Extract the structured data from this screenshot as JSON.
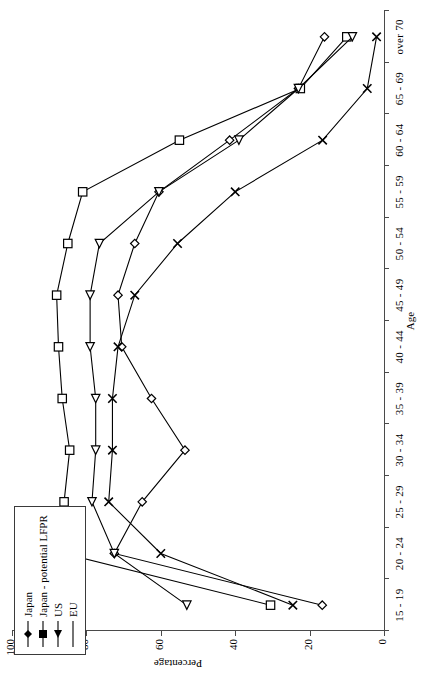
{
  "chart_data": {
    "type": "line",
    "title": "",
    "xlabel": "Age",
    "ylabel": "Percentage",
    "ylim": [
      0,
      100
    ],
    "yticks": [
      0,
      20,
      40,
      60,
      80,
      100
    ],
    "grid": false,
    "legend_position": "top-left",
    "categories": [
      "15 - 19",
      "20 - 24",
      "25 - 29",
      "30 - 34",
      "35 - 39",
      "40 - 44",
      "45 - 49",
      "50 - 54",
      "55 - 59",
      "60 - 64",
      "65 - 69",
      "over 70"
    ],
    "series": [
      {
        "name": "Japan",
        "marker": "diamond",
        "values": [
          16.6,
          72.5,
          65.0,
          53.5,
          62.5,
          70.5,
          71.5,
          67.0,
          60.5,
          41.5,
          23.0,
          16.0
        ]
      },
      {
        "name": "Japan - potential LFPR",
        "marker": "square",
        "values": [
          30.5,
          86.0,
          86.0,
          84.5,
          86.5,
          87.5,
          88.0,
          85.0,
          81.0,
          55.0,
          22.5,
          10.0
        ]
      },
      {
        "name": "US",
        "marker": "triangle",
        "values": [
          53.0,
          72.5,
          78.5,
          77.5,
          77.5,
          79.0,
          79.0,
          76.5,
          60.5,
          39.0,
          23.0,
          8.5
        ]
      },
      {
        "name": "EU",
        "marker": "x",
        "values": [
          24.5,
          60.0,
          74.0,
          73.0,
          73.0,
          71.5,
          67.0,
          55.5,
          40.0,
          16.5,
          4.5,
          2.0
        ]
      }
    ]
  },
  "legend": {
    "items": [
      {
        "label": "Japan",
        "marker": "diamond"
      },
      {
        "label": "Japan - potential LFPR",
        "marker": "square"
      },
      {
        "label": "US",
        "marker": "triangle"
      },
      {
        "label": "EU",
        "marker": "x"
      }
    ]
  },
  "colors": {
    "line": "#000000",
    "axis": "#4a4a4a",
    "background": "#ffffff"
  }
}
